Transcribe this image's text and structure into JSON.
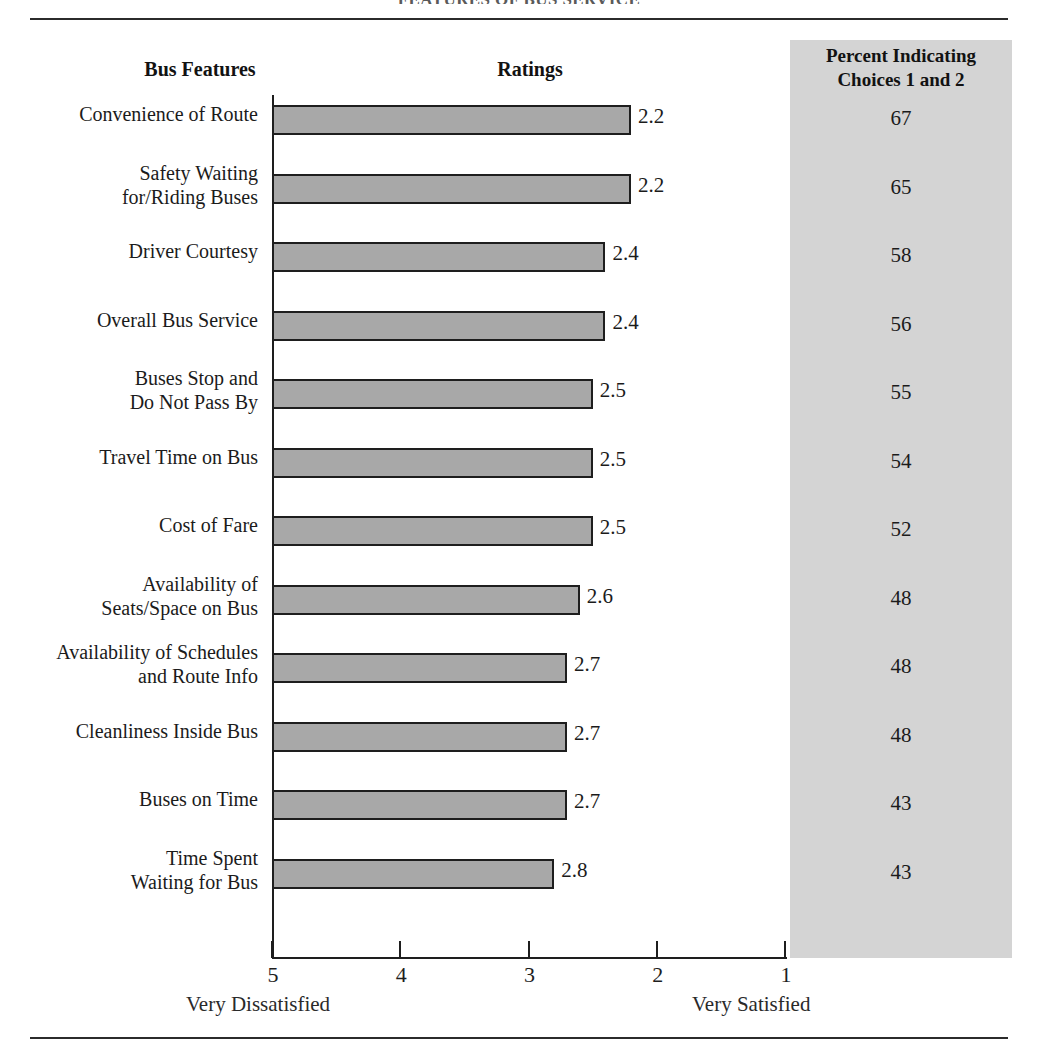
{
  "figure": {
    "title": "FEATURES OF BUS SERVICE",
    "panel_color": "#d4d4d4",
    "bar_fill": "#a8a8a8",
    "bar_stroke": "#1e1e1e"
  },
  "headers": {
    "features": "Bus Features",
    "ratings": "Ratings",
    "percent_line1": "Percent Indicating",
    "percent_line2": "Choices 1 and 2"
  },
  "axis": {
    "ticks": [
      "5",
      "4",
      "3",
      "2",
      "1"
    ],
    "anchor_low": "Very Dissatisfied",
    "anchor_high": "Very Satisfied"
  },
  "rows": [
    {
      "label_line1": "Convenience of Route",
      "label_line2": "",
      "rating": "2.2",
      "percent": "67"
    },
    {
      "label_line1": "Safety Waiting",
      "label_line2": "for/Riding Buses",
      "rating": "2.2",
      "percent": "65"
    },
    {
      "label_line1": "Driver Courtesy",
      "label_line2": "",
      "rating": "2.4",
      "percent": "58"
    },
    {
      "label_line1": "Overall Bus Service",
      "label_line2": "",
      "rating": "2.4",
      "percent": "56"
    },
    {
      "label_line1": "Buses Stop and",
      "label_line2": "Do Not Pass By",
      "rating": "2.5",
      "percent": "55"
    },
    {
      "label_line1": "Travel Time on Bus",
      "label_line2": "",
      "rating": "2.5",
      "percent": "54"
    },
    {
      "label_line1": "Cost of Fare",
      "label_line2": "",
      "rating": "2.5",
      "percent": "52"
    },
    {
      "label_line1": "Availability of",
      "label_line2": "Seats/Space on Bus",
      "rating": "2.6",
      "percent": "48"
    },
    {
      "label_line1": "Availability of Schedules",
      "label_line2": "and Route Info",
      "rating": "2.7",
      "percent": "48"
    },
    {
      "label_line1": "Cleanliness Inside Bus",
      "label_line2": "",
      "rating": "2.7",
      "percent": "48"
    },
    {
      "label_line1": "Buses on Time",
      "label_line2": "",
      "rating": "2.7",
      "percent": "43"
    },
    {
      "label_line1": "Time Spent",
      "label_line2": "Waiting for Bus",
      "rating": "2.8",
      "percent": "43"
    }
  ],
  "chart_data": {
    "type": "bar",
    "title": "FEATURES OF BUS SERVICE",
    "xlabel": "Ratings",
    "ylabel": "Bus Features",
    "orientation": "horizontal",
    "xlim": [
      5,
      1
    ],
    "x_reversed": true,
    "xticks": [
      5,
      4,
      3,
      2,
      1
    ],
    "x_anchor_labels": {
      "5": "Very Dissatisfied",
      "1": "Very Satisfied"
    },
    "grid": false,
    "legend": "none",
    "categories": [
      "Convenience of Route",
      "Safety Waiting for/Riding Buses",
      "Driver Courtesy",
      "Overall Bus Service",
      "Buses Stop and Do Not Pass By",
      "Travel Time on Bus",
      "Cost of Fare",
      "Availability of Seats/Space on Bus",
      "Availability of Schedules and Route Info",
      "Cleanliness Inside Bus",
      "Buses on Time",
      "Time Spent Waiting for Bus"
    ],
    "series": [
      {
        "name": "Ratings",
        "values": [
          2.2,
          2.2,
          2.4,
          2.4,
          2.5,
          2.5,
          2.5,
          2.6,
          2.7,
          2.7,
          2.7,
          2.8
        ]
      },
      {
        "name": "Percent Indicating Choices 1 and 2",
        "values": [
          67,
          65,
          58,
          56,
          55,
          54,
          52,
          48,
          48,
          48,
          43,
          43
        ]
      }
    ]
  }
}
